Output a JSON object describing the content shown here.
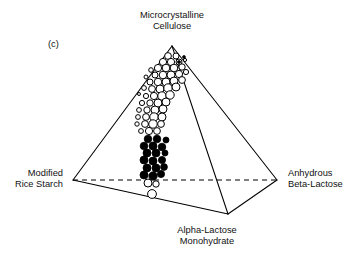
{
  "figure": {
    "panel_letter": "(c)",
    "background_color": "#ffffff",
    "line_color": "#000000"
  },
  "vertices": {
    "top": {
      "label_line1": "Microcrystalline",
      "label_line2": "Cellulose",
      "x": 172,
      "y": 46
    },
    "left": {
      "label_line1": "Modified",
      "label_line2": "Rice Starch",
      "x": 73,
      "y": 180
    },
    "right": {
      "label_line1": "Anhydrous",
      "label_line2": "Beta-Lactose",
      "x": 277,
      "y": 180
    },
    "front": {
      "label_line1": "Alpha-Lactose",
      "label_line2": "Monohydrate",
      "x": 228,
      "y": 214
    }
  },
  "chart_data": {
    "type": "scatter",
    "title": "",
    "xlabel": "",
    "ylabel": "",
    "axis_labels": [
      "Microcrystalline Cellulose",
      "Modified Rice Starch",
      "Anhydrous Beta-Lactose",
      "Alpha-Lactose Monohydrate"
    ],
    "grid": false,
    "legend": "none",
    "series": [
      {
        "name": "open-circles",
        "marker": "open circle",
        "points": [
          {
            "x": 168,
            "y": 56,
            "r": 3.4
          },
          {
            "x": 176,
            "y": 56,
            "r": 3.0
          },
          {
            "x": 163,
            "y": 62,
            "r": 3.6
          },
          {
            "x": 171,
            "y": 62,
            "r": 3.6
          },
          {
            "x": 179,
            "y": 62,
            "r": 3.0
          },
          {
            "x": 185,
            "y": 60,
            "r": 1.6
          },
          {
            "x": 158,
            "y": 68,
            "r": 3.6
          },
          {
            "x": 166,
            "y": 68,
            "r": 3.8
          },
          {
            "x": 174,
            "y": 68,
            "r": 3.8
          },
          {
            "x": 182,
            "y": 67,
            "r": 3.2
          },
          {
            "x": 151,
            "y": 70,
            "r": 2.3
          },
          {
            "x": 155,
            "y": 75,
            "r": 3.0
          },
          {
            "x": 163,
            "y": 75,
            "r": 3.8
          },
          {
            "x": 171,
            "y": 75,
            "r": 4.0
          },
          {
            "x": 179,
            "y": 74,
            "r": 3.6
          },
          {
            "x": 186,
            "y": 72,
            "r": 2.6
          },
          {
            "x": 146,
            "y": 77,
            "r": 2.0
          },
          {
            "x": 150,
            "y": 82,
            "r": 3.0
          },
          {
            "x": 158,
            "y": 82,
            "r": 3.8
          },
          {
            "x": 166,
            "y": 82,
            "r": 4.0
          },
          {
            "x": 174,
            "y": 81,
            "r": 4.0
          },
          {
            "x": 182,
            "y": 80,
            "r": 3.4
          },
          {
            "x": 144,
            "y": 88,
            "r": 2.4
          },
          {
            "x": 152,
            "y": 89,
            "r": 3.4
          },
          {
            "x": 160,
            "y": 89,
            "r": 4.0
          },
          {
            "x": 168,
            "y": 88,
            "r": 4.2
          },
          {
            "x": 176,
            "y": 87,
            "r": 4.0
          },
          {
            "x": 139,
            "y": 94,
            "r": 1.5
          },
          {
            "x": 146,
            "y": 96,
            "r": 2.6
          },
          {
            "x": 154,
            "y": 96,
            "r": 3.6
          },
          {
            "x": 162,
            "y": 96,
            "r": 4.2
          },
          {
            "x": 170,
            "y": 95,
            "r": 4.2
          },
          {
            "x": 142,
            "y": 103,
            "r": 2.6
          },
          {
            "x": 150,
            "y": 103,
            "r": 3.2
          },
          {
            "x": 158,
            "y": 103,
            "r": 4.0
          },
          {
            "x": 166,
            "y": 102,
            "r": 4.0
          },
          {
            "x": 139,
            "y": 110,
            "r": 2.4
          },
          {
            "x": 147,
            "y": 110,
            "r": 3.2
          },
          {
            "x": 155,
            "y": 110,
            "r": 4.0
          },
          {
            "x": 163,
            "y": 109,
            "r": 4.0
          },
          {
            "x": 138,
            "y": 117,
            "r": 2.4
          },
          {
            "x": 146,
            "y": 117,
            "r": 3.4
          },
          {
            "x": 154,
            "y": 117,
            "r": 4.2
          },
          {
            "x": 162,
            "y": 117,
            "r": 4.0
          },
          {
            "x": 137,
            "y": 124,
            "r": 2.2
          },
          {
            "x": 145,
            "y": 124,
            "r": 3.4
          },
          {
            "x": 153,
            "y": 124,
            "r": 4.2
          },
          {
            "x": 161,
            "y": 124,
            "r": 3.4
          },
          {
            "x": 141,
            "y": 131,
            "r": 2.4
          },
          {
            "x": 149,
            "y": 131,
            "r": 3.6
          },
          {
            "x": 157,
            "y": 131,
            "r": 3.4
          },
          {
            "x": 148,
            "y": 183,
            "r": 4.0
          },
          {
            "x": 156,
            "y": 184,
            "r": 3.2
          },
          {
            "x": 152,
            "y": 194,
            "r": 4.4
          }
        ]
      },
      {
        "name": "filled-circles",
        "marker": "filled circle",
        "points": [
          {
            "x": 148,
            "y": 139,
            "r": 3.8
          },
          {
            "x": 157,
            "y": 139,
            "r": 3.8
          },
          {
            "x": 166,
            "y": 140,
            "r": 3.0
          },
          {
            "x": 144,
            "y": 146,
            "r": 3.8
          },
          {
            "x": 153,
            "y": 146,
            "r": 4.0
          },
          {
            "x": 162,
            "y": 147,
            "r": 3.8
          },
          {
            "x": 147,
            "y": 153,
            "r": 4.0
          },
          {
            "x": 156,
            "y": 153,
            "r": 4.0
          },
          {
            "x": 165,
            "y": 153,
            "r": 3.0
          },
          {
            "x": 144,
            "y": 160,
            "r": 4.0
          },
          {
            "x": 153,
            "y": 161,
            "r": 4.0
          },
          {
            "x": 162,
            "y": 160,
            "r": 3.6
          },
          {
            "x": 147,
            "y": 168,
            "r": 4.0
          },
          {
            "x": 156,
            "y": 168,
            "r": 4.0
          },
          {
            "x": 164,
            "y": 167,
            "r": 3.4
          },
          {
            "x": 144,
            "y": 175,
            "r": 4.0
          },
          {
            "x": 153,
            "y": 176,
            "r": 4.2
          },
          {
            "x": 161,
            "y": 174,
            "r": 3.6
          },
          {
            "x": 179,
            "y": 62,
            "r": 1.5
          },
          {
            "x": 184,
            "y": 57,
            "r": 1.4
          }
        ]
      }
    ]
  }
}
